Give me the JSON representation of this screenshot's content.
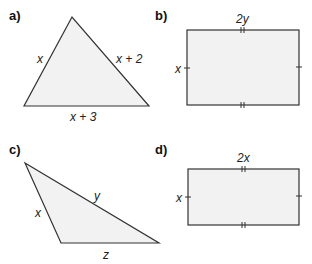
{
  "figures": [
    {
      "id": "a",
      "part_label": "a)",
      "shape": "triangle",
      "side_labels": {
        "left": "x",
        "right": "x + 2",
        "bottom": "x + 3"
      }
    },
    {
      "id": "b",
      "part_label": "b)",
      "shape": "rectangle",
      "side_labels": {
        "top": "2y",
        "left": "x"
      },
      "tick_marks": {
        "top_bottom": "double",
        "left_right": "single"
      }
    },
    {
      "id": "c",
      "part_label": "c)",
      "shape": "triangle",
      "side_labels": {
        "left": "x",
        "hypotenuse": "y",
        "bottom": "z"
      }
    },
    {
      "id": "d",
      "part_label": "d)",
      "shape": "rectangle",
      "side_labels": {
        "top": "2x",
        "left": "x"
      },
      "tick_marks": {
        "top_bottom": "double",
        "left_right": "single"
      }
    }
  ],
  "colors": {
    "fill": "#f2f2f2",
    "stroke": "#333333"
  }
}
